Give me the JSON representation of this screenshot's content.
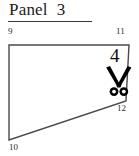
{
  "figure": {
    "title": "Panel  3",
    "vertex_labels": {
      "top_left": "9",
      "top_right": "11",
      "bottom_right": "12",
      "bottom_left": "10"
    },
    "cut_marker": {
      "number": "4",
      "icon": "scissors-icon"
    },
    "colors": {
      "outline": "#4a4a4a",
      "fill": "#ffffff",
      "text": "#1a1a1a",
      "scissors": "#000000"
    },
    "shape": {
      "type": "quadrilateral",
      "points": "9,45 129,45 126,101 9,140"
    }
  }
}
